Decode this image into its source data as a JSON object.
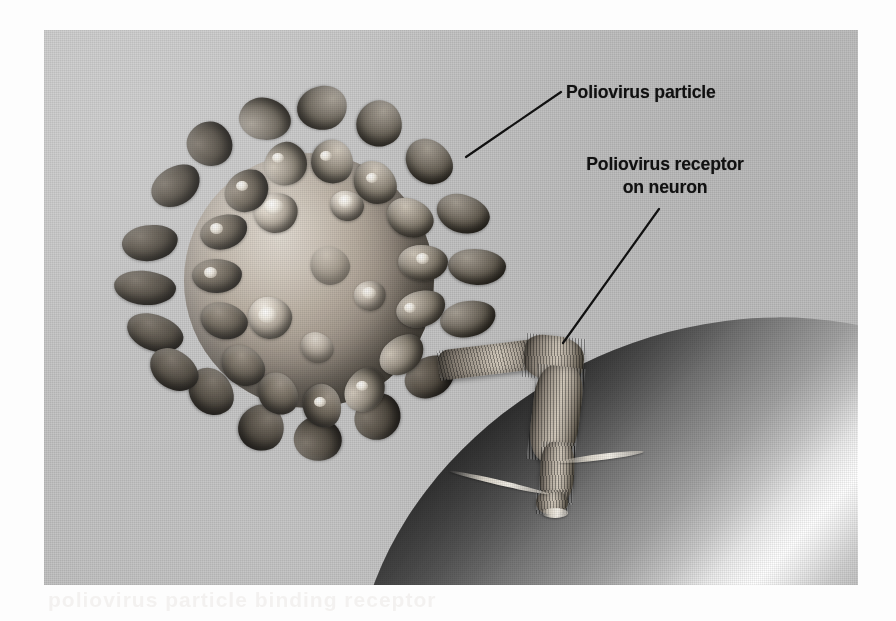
{
  "figure": {
    "kind": "micrograph-illustration",
    "plate_background_color": "#c6c6c6",
    "page_background_color": "#fdfdfd",
    "ghost_text": "poliovirus   particle   binding   receptor"
  },
  "labels": {
    "particle": "Poliovirus particle",
    "receptor_line1": "Poliovirus receptor",
    "receptor_line2": "on neuron"
  },
  "leaders": [
    {
      "name": "leader-to-particle",
      "x1": 466,
      "y1": 157,
      "x2": 561,
      "y2": 92,
      "color": "#111111",
      "width": 2.2
    },
    {
      "name": "leader-to-receptor",
      "x1": 563,
      "y1": 343,
      "x2": 659,
      "y2": 209,
      "color": "#111111",
      "width": 2.2
    }
  ],
  "objects": {
    "virus_particle": {
      "name": "poliovirus-particle",
      "center_x": 270,
      "center_y": 255,
      "capsid_color": "#b8ad9f",
      "spike_color": "#7b7265",
      "spike_count": 44
    },
    "receptor": {
      "name": "poliovirus-receptor",
      "color": "#c9c0b2",
      "texture": "ribbed"
    },
    "neuron": {
      "name": "neuron-cell-surface",
      "highlight_color": "#ffffff",
      "shadow_color": "#1d1d1d",
      "body_color": "#9a9a9a"
    }
  }
}
